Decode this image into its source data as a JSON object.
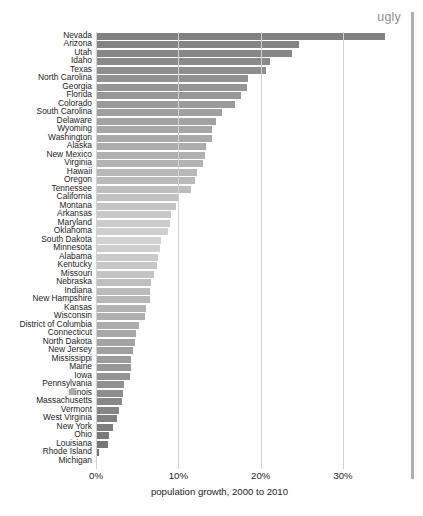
{
  "annotation": {
    "text": "ugly"
  },
  "axis": {
    "xlabel": "population growth, 2000 to 2010",
    "xticks": [
      "0%",
      "10%",
      "20%",
      "30%"
    ]
  },
  "chart_data": {
    "type": "bar",
    "orientation": "horizontal",
    "title": "",
    "xlabel": "population growth, 2000 to 2010",
    "ylabel": "",
    "xlim": [
      0,
      36
    ],
    "xticks": [
      0,
      10,
      20,
      30
    ],
    "xtick_labels": [
      "0%",
      "10%",
      "20%",
      "30%"
    ],
    "grid": "vertical",
    "legend": "none",
    "annotation": "ugly",
    "sorted": "descending",
    "categories": [
      "Nevada",
      "Arizona",
      "Utah",
      "Idaho",
      "Texas",
      "North Carolina",
      "Georgia",
      "Florida",
      "Colorado",
      "South Carolina",
      "Delaware",
      "Wyoming",
      "Washington",
      "Alaska",
      "New Mexico",
      "Virginia",
      "Hawaii",
      "Oregon",
      "Tennessee",
      "California",
      "Montana",
      "Arkansas",
      "Maryland",
      "Oklahoma",
      "South Dakota",
      "Minnesota",
      "Alabama",
      "Kentucky",
      "Missouri",
      "Nebraska",
      "Indiana",
      "New Hampshire",
      "Kansas",
      "Wisconsin",
      "District of Columbia",
      "Connecticut",
      "North Dakota",
      "New Jersey",
      "Mississippi",
      "Maine",
      "Iowa",
      "Pennsylvania",
      "Illinois",
      "Massachusetts",
      "Vermont",
      "West Virginia",
      "New York",
      "Ohio",
      "Louisiana",
      "Rhode Island",
      "Michigan"
    ],
    "values": [
      35.1,
      24.6,
      23.8,
      21.1,
      20.6,
      18.5,
      18.3,
      17.6,
      16.9,
      15.3,
      14.6,
      14.1,
      14.1,
      13.3,
      13.2,
      13.0,
      12.3,
      12.0,
      11.5,
      10.0,
      9.7,
      9.1,
      9.0,
      8.7,
      7.9,
      7.8,
      7.5,
      7.4,
      7.0,
      6.7,
      6.6,
      6.5,
      6.1,
      6.0,
      5.2,
      4.9,
      4.7,
      4.5,
      4.3,
      4.2,
      4.1,
      3.4,
      3.3,
      3.1,
      2.8,
      2.5,
      2.1,
      1.6,
      1.4,
      0.4,
      -0.6
    ]
  },
  "colors": {
    "bar_dark": "#808080",
    "bar_light": "#cfcfcf",
    "bar_bottom": "#6e6e6e",
    "gridline": "#d2d2d2",
    "annotation": "#8e8e8e",
    "text": "#1d1d1d"
  }
}
